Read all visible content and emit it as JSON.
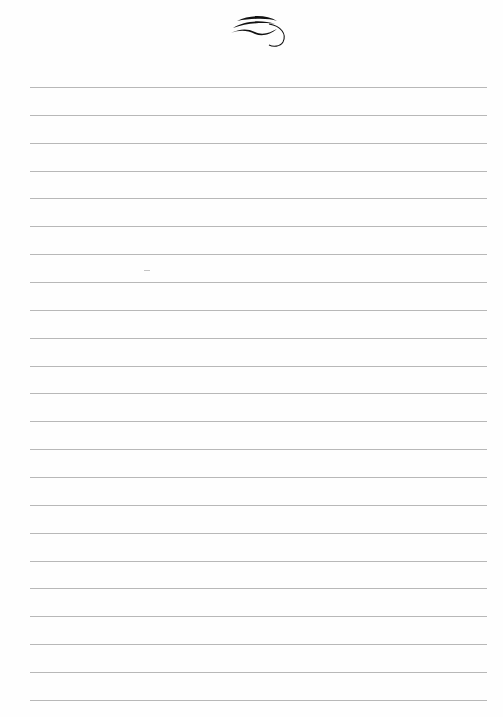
{
  "page": {
    "type": "ruled-notepaper",
    "background_color": "#fefefe",
    "line_color": "#b8b8b8",
    "ornament_icon": "calligraphic-flourish-icon",
    "line_count": 23,
    "first_line_y": 87,
    "line_spacing": 27.86,
    "line_left": 30,
    "line_width": 457
  }
}
